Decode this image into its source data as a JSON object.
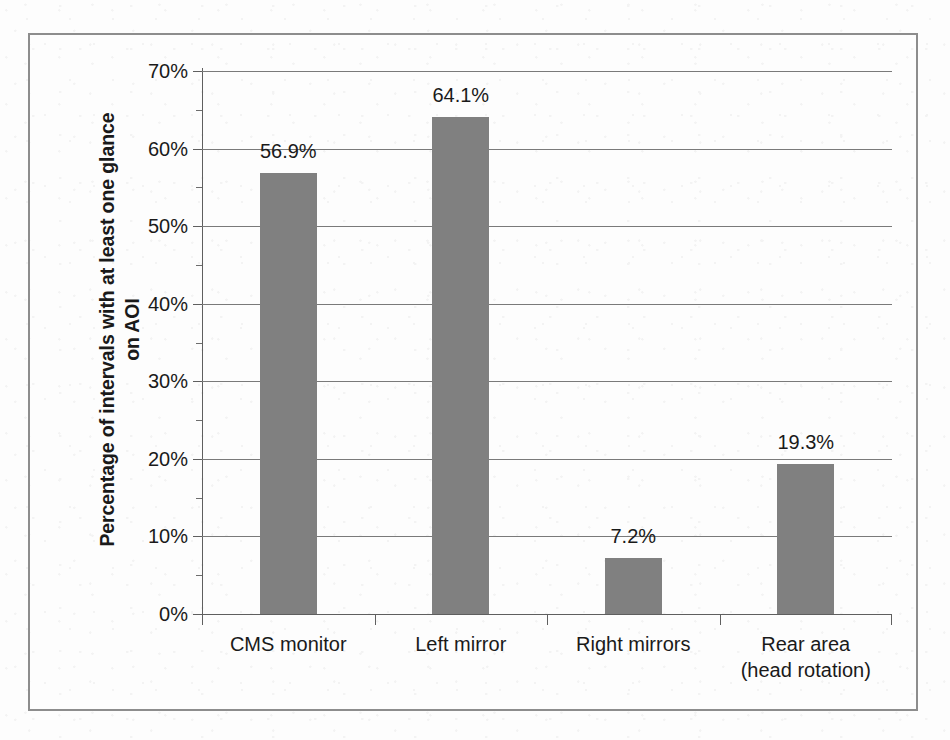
{
  "figure": {
    "y_axis_title_line1": "Percentage of intervals with at least one glance",
    "y_axis_title_line2": "on AOI"
  },
  "chart_data": {
    "type": "bar",
    "title": "",
    "subtitle": "",
    "xlabel": "",
    "ylabel": "Percentage of intervals with at least one glance on AOI",
    "categories": [
      "CMS monitor",
      "Left mirror",
      "Right mirrors",
      "Rear area\n(head rotation)"
    ],
    "category_lines": [
      [
        "CMS monitor"
      ],
      [
        "Left mirror"
      ],
      [
        "Right mirrors"
      ],
      [
        "Rear area",
        "(head rotation)"
      ]
    ],
    "values": [
      56.9,
      64.1,
      7.2,
      19.3
    ],
    "data_labels": [
      "56.9%",
      "64.1%",
      "7.2%",
      "19.3%"
    ],
    "ylim": [
      0,
      70
    ],
    "y_major_step": 10,
    "y_minor_step": 5,
    "y_tick_labels": [
      "70%",
      "60%",
      "50%",
      "40%",
      "30%",
      "20%",
      "10%",
      "0%"
    ],
    "y_tick_values": [
      70,
      60,
      50,
      40,
      30,
      20,
      10,
      0
    ],
    "grid": "horizontal",
    "legend": "none",
    "bar_color": "#808080",
    "axis_color": "#5f5f5f",
    "grid_color": "#7a7a7a",
    "text_color": "#1a1a1a",
    "frame_color": "#8d8d8d",
    "background_color": "#fdfdfd"
  }
}
